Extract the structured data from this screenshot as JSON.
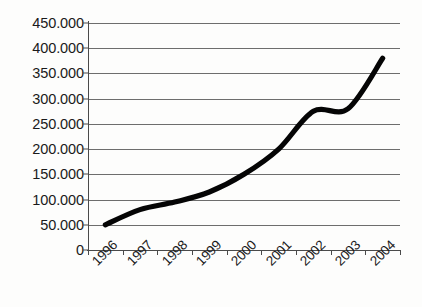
{
  "chart_data": {
    "type": "line",
    "title": "",
    "subtitle": "",
    "xlabel": "",
    "ylabel": "",
    "categories": [
      "1996",
      "1997",
      "1998",
      "1999",
      "2000",
      "2001",
      "2002",
      "2003",
      "2004"
    ],
    "series": [
      {
        "name": "",
        "values": [
          50000,
          80000,
          95000,
          115000,
          150000,
          200000,
          275000,
          280000,
          380000
        ]
      }
    ],
    "y_tick_labels": [
      "450.000",
      "400.000",
      "350.000",
      "300.000",
      "250.000",
      "200.000",
      "150.000",
      "100.000",
      "50.000",
      "0"
    ],
    "y_tick_values": [
      450000,
      400000,
      350000,
      300000,
      250000,
      200000,
      150000,
      100000,
      50000,
      0
    ],
    "ylim": [
      0,
      450000
    ],
    "y_tick_step": 50000,
    "grid": "horizontal",
    "legend": "none",
    "markers": "none",
    "line_color": "#050505",
    "gridline_color": "#6d6d6d",
    "axis_color": "#4a4a4a",
    "background_color": "#fdfdfc",
    "x_label_rotation": -45,
    "thousands_separator": "."
  }
}
